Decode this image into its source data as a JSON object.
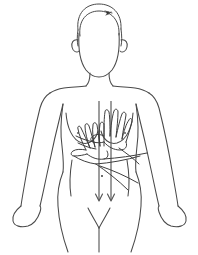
{
  "figure": {
    "alt_text": "Line drawing of a female upper body with both hands placed over the left breast and two long downward arrows indicating a top-to-bottom vertical scanning motion.",
    "background_color": "#ffffff",
    "line_color": "#4a4a4a",
    "arrow_color": "#555555",
    "accent_color": "#2a2a2a",
    "stroke_width": 1.05
  },
  "parts": {
    "head": "head-outline",
    "hair": "hair-outline",
    "ear_left": "left-ear",
    "ear_right": "right-ear",
    "neck": "neck-outline",
    "torso": "torso-outline",
    "breast_left": "left-breast-contour",
    "breast_right": "right-breast-contour",
    "nipple_left": "left-nipple",
    "nipple_right": "right-nipple",
    "arm_left": "left-arm-outline",
    "arm_right": "right-arm-outline",
    "hip": "hip-and-pelvis-outline",
    "groin": "groin-v-line",
    "hand_upper": "upper-examining-hand",
    "hand_lower": "lower-examining-hand",
    "forearm": "examining-forearm-lines",
    "head_mark": "head-top-marker"
  },
  "arrows": {
    "count": 2,
    "direction": "down",
    "label": "vertical-strip-motion",
    "items": [
      {
        "name": "arrow-left",
        "x": 99,
        "y_start": 101,
        "y_end": 201
      },
      {
        "name": "arrow-right",
        "x": 111,
        "y_start": 101,
        "y_end": 201
      }
    ],
    "midpoint_marker": {
      "name": "arrow-midpoint-dot",
      "x": 102,
      "y": 176
    }
  },
  "nipples": [
    {
      "name": "left-nipple",
      "x": 78,
      "y": 133
    },
    {
      "name": "right-nipple",
      "x": 125,
      "y": 133
    }
  ]
}
